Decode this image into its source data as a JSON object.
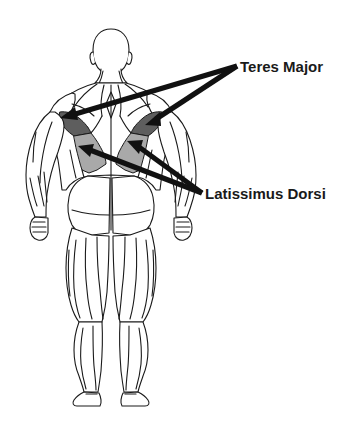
{
  "figure": {
    "background_color": "#ffffff",
    "outline_color": "#1a1a1a"
  },
  "labels": [
    {
      "id": "teres-major",
      "text": "Teres Major",
      "x": 240,
      "y": 72,
      "font_size": 15,
      "color": "#1a1a1a",
      "pointer_origin": {
        "x": 237,
        "y": 66
      },
      "pointer_tips": [
        {
          "x": 62,
          "y": 117
        },
        {
          "x": 147,
          "y": 123
        }
      ]
    },
    {
      "id": "latissimus-dorsi",
      "text": "Latissimus Dorsi",
      "x": 205,
      "y": 199,
      "font_size": 15,
      "color": "#1a1a1a",
      "pointer_origin": {
        "x": 202,
        "y": 193
      },
      "pointer_tips": [
        {
          "x": 80,
          "y": 147
        },
        {
          "x": 129,
          "y": 143
        }
      ]
    }
  ],
  "highlights": [
    {
      "id": "teres-major-left",
      "muscle": "Teres Major",
      "side": "left",
      "fill": "#5e5e5e"
    },
    {
      "id": "teres-major-right",
      "muscle": "Teres Major",
      "side": "right",
      "fill": "#5e5e5e"
    },
    {
      "id": "latissimus-dorsi-left",
      "muscle": "Latissimus Dorsi",
      "side": "left",
      "fill": "#a9a9a9"
    },
    {
      "id": "latissimus-dorsi-right",
      "muscle": "Latissimus Dorsi",
      "side": "right",
      "fill": "#a9a9a9"
    }
  ],
  "colors": {
    "teres_major_fill": "#5e5e5e",
    "latissimus_fill": "#a9a9a9",
    "pointer_color": "#111111",
    "body_outline": "#1a1a1a",
    "body_fill": "#ffffff"
  }
}
